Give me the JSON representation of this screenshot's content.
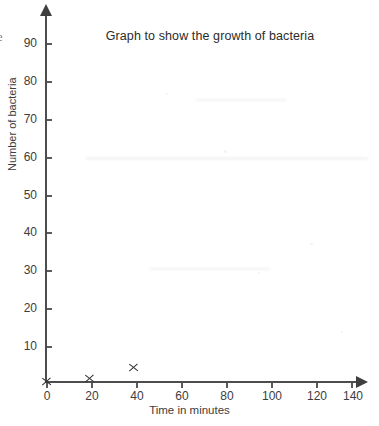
{
  "chart_data": {
    "type": "scatter",
    "title": "Graph to show the growth of bacteria",
    "xlabel": "Time in minutes",
    "ylabel": "Number of bacteria",
    "xlim": [
      0,
      140
    ],
    "ylim": [
      0,
      95
    ],
    "grid": false,
    "legend": null,
    "x_ticks": [
      0,
      20,
      40,
      60,
      80,
      100,
      120,
      140
    ],
    "y_ticks": [
      10,
      20,
      30,
      40,
      50,
      60,
      70,
      80,
      90
    ],
    "x_tick_labels": [
      "0",
      "20",
      "40",
      "60",
      "80",
      "100",
      "120",
      "140"
    ],
    "y_tick_labels": [
      "10",
      "20",
      "30",
      "40",
      "50",
      "60",
      "70",
      "80",
      "90"
    ],
    "x_tick_interval": 20,
    "y_tick_interval": 10,
    "marker": "x",
    "points": [
      {
        "x": 0,
        "y": 0,
        "label": "x"
      },
      {
        "x": 20,
        "y": 1,
        "label": "x"
      },
      {
        "x": 40,
        "y": 4,
        "label": "x"
      }
    ],
    "series": [
      {
        "name": "Number of bacteria",
        "x": [
          0,
          20,
          40
        ],
        "values": [
          0,
          1,
          4
        ]
      }
    ],
    "colors": {
      "axis": "#4d4d4d",
      "tick": "#5a5a5a",
      "text": "#3d3d3d",
      "title": "#2b2b2b",
      "marker": "#2f2f2f",
      "background": "#ffffff"
    }
  },
  "artifacts": {
    "edge_glyph": "e"
  }
}
